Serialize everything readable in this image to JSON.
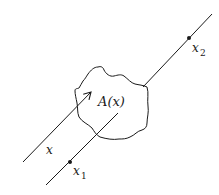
{
  "diagram": {
    "region_label": "A(x)",
    "vector_label": "x",
    "point1": {
      "label": "x",
      "subscript": "1"
    },
    "point2": {
      "label": "x",
      "subscript": "2"
    }
  },
  "colors": {
    "stroke": "#1a1a1a",
    "background": "#ffffff"
  }
}
